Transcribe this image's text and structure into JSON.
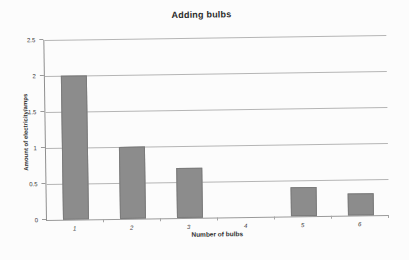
{
  "page": {
    "background_color": "#fcfcfc"
  },
  "chart_data": {
    "type": "bar",
    "title": "Adding bulbs",
    "xlabel": "Number of bulbs",
    "ylabel": "Amount of electricity/amps",
    "categories": [
      "1",
      "2",
      "3",
      "4",
      "5",
      "6"
    ],
    "values": [
      2,
      1,
      0.7,
      0,
      0.4,
      0.3
    ],
    "ylim": [
      0,
      2.5
    ],
    "yticks": [
      0,
      0.5,
      1,
      1.5,
      2,
      2.5
    ],
    "ytick_labels": [
      "0",
      "0.5",
      "1",
      "1.5",
      "2",
      "2.5"
    ],
    "grid": true,
    "legend": "none",
    "bar_color": "#8c8c8c",
    "bar_edge_color": "#7b7b7b",
    "gridline_color": "#b5b5b5"
  }
}
